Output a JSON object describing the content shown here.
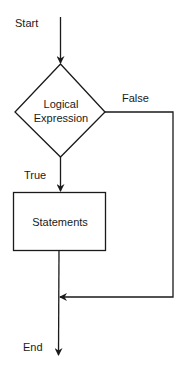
{
  "diagram": {
    "type": "flowchart",
    "start_label": "Start",
    "end_label": "End",
    "decision": {
      "line1": "Logical",
      "line2": "Expression"
    },
    "process": {
      "label": "Statements"
    },
    "branches": {
      "true_label": "True",
      "false_label": "False"
    },
    "colors": {
      "stroke": "#1a1a1a",
      "background": "#ffffff"
    }
  }
}
